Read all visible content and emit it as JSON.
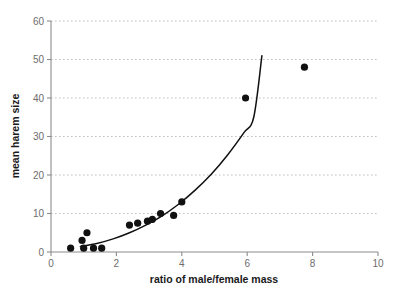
{
  "chart_data": {
    "type": "scatter",
    "title": "",
    "xlabel": "ratio of male/female mass",
    "ylabel": "mean harem size",
    "xlim": [
      0,
      10
    ],
    "ylim": [
      0,
      60
    ],
    "xticks": [
      0,
      2,
      4,
      6,
      8,
      10
    ],
    "yticks": [
      0,
      10,
      20,
      30,
      40,
      50,
      60
    ],
    "xtick_labels": [
      "0",
      "2",
      "4",
      "6",
      "8",
      "10"
    ],
    "ytick_labels": [
      "0",
      "10",
      "20",
      "30",
      "40",
      "50",
      "60"
    ],
    "grid": "horizontal-dashed",
    "legend": "none",
    "points": [
      {
        "x": 0.6,
        "y": 1.0
      },
      {
        "x": 0.95,
        "y": 3.0
      },
      {
        "x": 1.0,
        "y": 1.0
      },
      {
        "x": 1.1,
        "y": 5.0
      },
      {
        "x": 1.3,
        "y": 1.0
      },
      {
        "x": 1.55,
        "y": 1.0
      },
      {
        "x": 2.4,
        "y": 7.0
      },
      {
        "x": 2.65,
        "y": 7.5
      },
      {
        "x": 2.95,
        "y": 8.0
      },
      {
        "x": 3.1,
        "y": 8.5
      },
      {
        "x": 3.35,
        "y": 10.0
      },
      {
        "x": 3.75,
        "y": 9.5
      },
      {
        "x": 4.0,
        "y": 13.0
      },
      {
        "x": 5.95,
        "y": 40.0
      },
      {
        "x": 7.75,
        "y": 48.0
      }
    ],
    "fit_curve": {
      "label": "fitted trend line",
      "points": [
        {
          "x": 0.9,
          "y": 1.4
        },
        {
          "x": 1.4,
          "y": 2.2
        },
        {
          "x": 1.9,
          "y": 3.4
        },
        {
          "x": 2.4,
          "y": 5.0
        },
        {
          "x": 2.9,
          "y": 7.0
        },
        {
          "x": 3.4,
          "y": 9.4
        },
        {
          "x": 3.9,
          "y": 12.4
        },
        {
          "x": 4.4,
          "y": 16.0
        },
        {
          "x": 4.9,
          "y": 20.2
        },
        {
          "x": 5.4,
          "y": 25.2
        },
        {
          "x": 5.9,
          "y": 31.0
        },
        {
          "x": 6.2,
          "y": 35.0
        },
        {
          "x": 6.45,
          "y": 51.0
        }
      ]
    }
  },
  "axes": {
    "x_title": "ratio of male/female mass",
    "y_title": "mean harem size"
  }
}
